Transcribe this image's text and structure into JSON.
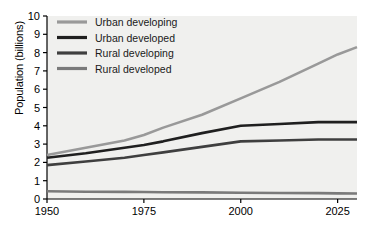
{
  "chart_data": {
    "type": "line",
    "title": "",
    "xlabel": "",
    "ylabel": "Population (billions)",
    "xlim": [
      1950,
      2030
    ],
    "ylim": [
      0,
      10
    ],
    "xticks": [
      1950,
      1975,
      2000,
      2025
    ],
    "yticks": [
      0,
      1,
      2,
      3,
      4,
      5,
      6,
      7,
      8,
      9,
      10
    ],
    "grid": false,
    "legend_position": "top-left-inside",
    "background": "#f0f0ee",
    "x": [
      1950,
      1960,
      1970,
      1975,
      1980,
      1990,
      2000,
      2010,
      2020,
      2025,
      2030
    ],
    "series": [
      {
        "name": "Urban developing",
        "color": "#999999",
        "values": [
          2.4,
          2.8,
          3.2,
          3.5,
          3.9,
          4.6,
          5.5,
          6.4,
          7.4,
          7.9,
          8.3
        ]
      },
      {
        "name": "Urban developed",
        "color": "#1f1f1f",
        "values": [
          2.25,
          2.5,
          2.8,
          2.95,
          3.15,
          3.6,
          4.0,
          4.1,
          4.2,
          4.2,
          4.2
        ]
      },
      {
        "name": "Rural developing",
        "color": "#3f3f3f",
        "values": [
          1.85,
          2.05,
          2.25,
          2.4,
          2.55,
          2.85,
          3.15,
          3.2,
          3.25,
          3.25,
          3.25
        ]
      },
      {
        "name": "Rural developed",
        "color": "#7a7a7a",
        "values": [
          0.42,
          0.4,
          0.39,
          0.38,
          0.37,
          0.36,
          0.34,
          0.33,
          0.32,
          0.31,
          0.3
        ]
      }
    ]
  },
  "axes": {
    "ytitle": "Population (billions)",
    "ytick_labels": [
      "10",
      "9",
      "8",
      "7",
      "6",
      "5",
      "4",
      "3",
      "2",
      "1",
      "0"
    ],
    "xtick_labels": [
      "1950",
      "1975",
      "2000",
      "2025"
    ]
  },
  "legend": {
    "items": [
      {
        "label": "Urban developing",
        "color": "#999999"
      },
      {
        "label": "Urban developed",
        "color": "#1f1f1f"
      },
      {
        "label": "Rural developing",
        "color": "#3f3f3f"
      },
      {
        "label": "Rural developed",
        "color": "#7a7a7a"
      }
    ]
  }
}
